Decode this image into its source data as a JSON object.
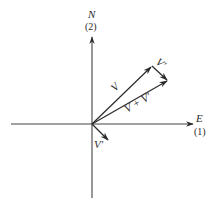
{
  "diagram": {
    "type": "vector-addition",
    "colors": {
      "background": "#ffffff",
      "ink": "#2a2a2a",
      "axis": "#444444"
    },
    "axes": {
      "horizontal": {
        "label": "E",
        "index": "(1)"
      },
      "vertical": {
        "label": "N",
        "index": "(2)"
      }
    },
    "vectors": [
      {
        "id": "V",
        "label": "V",
        "from": "origin",
        "to": "V-tip"
      },
      {
        "id": "V-prime-translated",
        "label": "V'",
        "from": "V-tip",
        "to": "sum-tip"
      },
      {
        "id": "V-plus-V-prime",
        "label": "V + V'",
        "from": "origin",
        "to": "sum-tip"
      },
      {
        "id": "V-prime",
        "label": "V'",
        "from": "origin",
        "to": "V'-tip"
      }
    ]
  }
}
